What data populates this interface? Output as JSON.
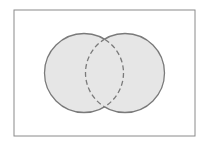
{
  "diagram": {
    "type": "venn",
    "universe": {
      "x": 14,
      "y": 10,
      "width": 181,
      "height": 126,
      "stroke": "#8a8a8a"
    },
    "sets": [
      {
        "name": "A",
        "cx": 84,
        "cy": 73,
        "r": 39.5
      },
      {
        "name": "B",
        "cx": 125,
        "cy": 73,
        "r": 39.5
      }
    ],
    "shaded_region": "A ∪ B",
    "colors": {
      "fill": "#e6e6e6",
      "stroke": "#7a7a7a",
      "background": "#ffffff"
    }
  }
}
